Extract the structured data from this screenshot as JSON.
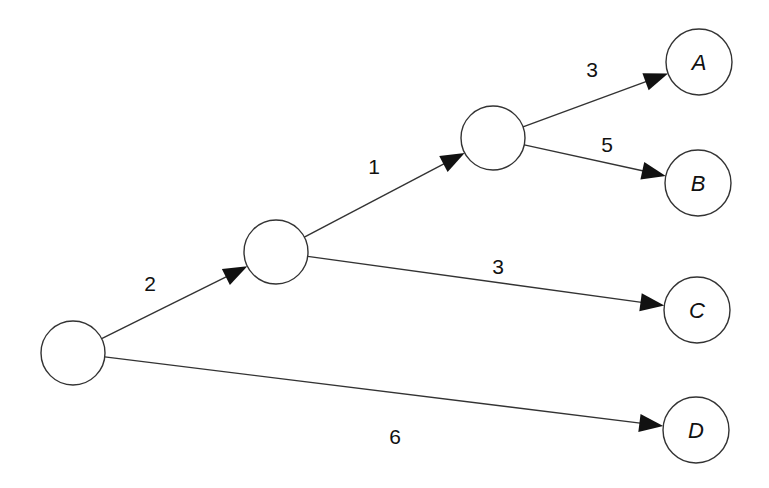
{
  "diagram": {
    "type": "decision-tree",
    "nodes": [
      {
        "id": "root",
        "label": "",
        "cx": 73,
        "cy": 353,
        "r": 32
      },
      {
        "id": "n1",
        "label": "",
        "cx": 276,
        "cy": 252,
        "r": 32
      },
      {
        "id": "n2",
        "label": "",
        "cx": 493,
        "cy": 138,
        "r": 32
      },
      {
        "id": "A",
        "label": "A",
        "cx": 699,
        "cy": 62,
        "r": 33
      },
      {
        "id": "B",
        "label": "B",
        "cx": 698,
        "cy": 183,
        "r": 33
      },
      {
        "id": "C",
        "label": "C",
        "cx": 697,
        "cy": 310,
        "r": 33
      },
      {
        "id": "D",
        "label": "D",
        "cx": 696,
        "cy": 430,
        "r": 33
      }
    ],
    "edges": [
      {
        "from": "root",
        "to": "n1",
        "weight": "2",
        "lx": 150,
        "ly": 291
      },
      {
        "from": "n1",
        "to": "n2",
        "weight": "1",
        "lx": 374,
        "ly": 174
      },
      {
        "from": "n2",
        "to": "A",
        "weight": "3",
        "lx": 592,
        "ly": 77
      },
      {
        "from": "n2",
        "to": "B",
        "weight": "5",
        "lx": 607,
        "ly": 152
      },
      {
        "from": "n1",
        "to": "C",
        "weight": "3",
        "lx": 498,
        "ly": 274
      },
      {
        "from": "root",
        "to": "D",
        "weight": "6",
        "lx": 395,
        "ly": 444
      }
    ]
  }
}
